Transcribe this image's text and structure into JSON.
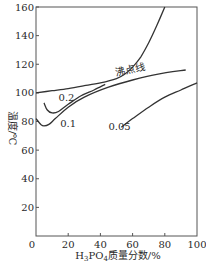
{
  "chart_data": {
    "type": "line",
    "title": "",
    "xlabel": "H3PO4质量分数/%",
    "xlabel_parts": {
      "prefix": "H",
      "sub1": "3",
      "mid": "PO",
      "sub2": "4",
      "suffix": "质量分数/%"
    },
    "ylabel": "温度/℃",
    "xlim": [
      0,
      100
    ],
    "ylim": [
      0,
      160
    ],
    "xticks": [
      0,
      20,
      40,
      60,
      80,
      100
    ],
    "yticks": [
      0,
      20,
      40,
      60,
      80,
      100,
      120,
      140,
      160
    ],
    "grid": false,
    "legend": "none (inline curve labels)",
    "series": [
      {
        "name": "沸点线",
        "label": "沸点线",
        "x": [
          0,
          10,
          20,
          30,
          40,
          50,
          55,
          60,
          65,
          70,
          75,
          80
        ],
        "y": [
          100,
          101.5,
          103,
          105,
          107,
          110,
          113,
          118,
          125,
          135,
          147,
          160
        ]
      },
      {
        "name": "0.2",
        "label": "0.2",
        "x": [
          5,
          7,
          10,
          14,
          20,
          28,
          36,
          43
        ],
        "y": [
          93,
          88,
          86,
          87,
          92,
          98,
          102,
          106
        ]
      },
      {
        "name": "0.1",
        "label": "0.1",
        "x": [
          0,
          3,
          5,
          8,
          12,
          20,
          30,
          45,
          60,
          75,
          93
        ],
        "y": [
          82,
          78,
          77,
          78,
          82,
          90,
          97,
          104,
          109,
          113,
          116
        ]
      },
      {
        "name": "0.05",
        "label": "0.05",
        "x": [
          53,
          60,
          70,
          80,
          90,
          100
        ],
        "y": [
          76,
          82,
          90,
          97,
          102,
          107
        ]
      }
    ],
    "annotations": [
      {
        "text": "沸点线",
        "x": 50,
        "y": 112
      },
      {
        "text": "0.2",
        "x": 14,
        "y": 94
      },
      {
        "text": "0.1",
        "x": 15,
        "y": 76
      },
      {
        "text": "0.05",
        "x": 45,
        "y": 74
      }
    ]
  }
}
